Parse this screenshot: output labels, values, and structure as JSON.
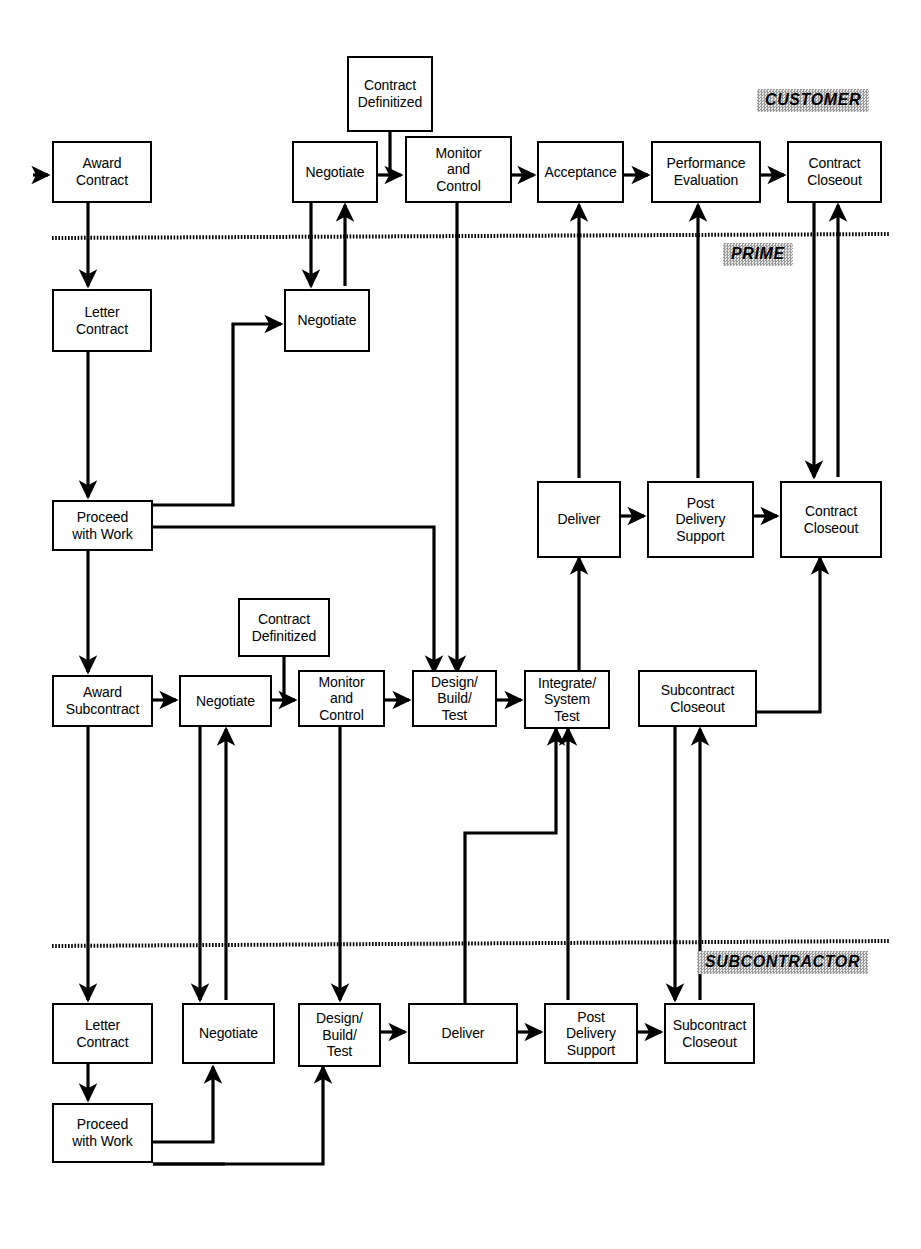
{
  "diagram": {
    "swimlanes": [
      {
        "id": "customer",
        "label": "CUSTOMER"
      },
      {
        "id": "prime",
        "label": "PRIME"
      },
      {
        "id": "subcontractor",
        "label": "SUBCONTRACTOR"
      }
    ],
    "nodes": [
      {
        "id": "cust-award-contract",
        "label": "Award\nContract",
        "lane": "customer"
      },
      {
        "id": "cust-contract-definitized",
        "label": "Contract\nDefinitized",
        "lane": "customer"
      },
      {
        "id": "cust-negotiate",
        "label": "Negotiate",
        "lane": "customer"
      },
      {
        "id": "cust-monitor-control",
        "label": "Monitor\nand\nControl",
        "lane": "customer"
      },
      {
        "id": "cust-acceptance",
        "label": "Acceptance",
        "lane": "customer"
      },
      {
        "id": "cust-performance-eval",
        "label": "Performance\nEvaluation",
        "lane": "customer"
      },
      {
        "id": "cust-contract-closeout",
        "label": "Contract\nCloseout",
        "lane": "customer"
      },
      {
        "id": "prime-letter-contract",
        "label": "Letter\nContract",
        "lane": "prime"
      },
      {
        "id": "prime-negotiate",
        "label": "Negotiate",
        "lane": "prime"
      },
      {
        "id": "prime-proceed-with-work",
        "label": "Proceed\nwith Work",
        "lane": "prime"
      },
      {
        "id": "prime-deliver",
        "label": "Deliver",
        "lane": "prime"
      },
      {
        "id": "prime-post-delivery",
        "label": "Post\nDelivery\nSupport",
        "lane": "prime"
      },
      {
        "id": "prime-contract-closeout",
        "label": "Contract\nCloseout",
        "lane": "prime"
      },
      {
        "id": "prime-award-subcontract",
        "label": "Award\nSubcontract",
        "lane": "prime"
      },
      {
        "id": "prime-sub-negotiate",
        "label": "Negotiate",
        "lane": "prime"
      },
      {
        "id": "prime-sub-definitized",
        "label": "Contract\nDefinitized",
        "lane": "prime"
      },
      {
        "id": "prime-sub-monitor",
        "label": "Monitor\nand\nControl",
        "lane": "prime"
      },
      {
        "id": "prime-design-build-test",
        "label": "Design/\nBuild/\nTest",
        "lane": "prime"
      },
      {
        "id": "prime-integrate-system",
        "label": "Integrate/\nSystem\nTest",
        "lane": "prime"
      },
      {
        "id": "prime-subcontract-closeout",
        "label": "Subcontract\nCloseout",
        "lane": "prime"
      },
      {
        "id": "sub-letter-contract",
        "label": "Letter\nContract",
        "lane": "subcontractor"
      },
      {
        "id": "sub-negotiate",
        "label": "Negotiate",
        "lane": "subcontractor"
      },
      {
        "id": "sub-design-build-test",
        "label": "Design/\nBuild/\nTest",
        "lane": "subcontractor"
      },
      {
        "id": "sub-deliver",
        "label": "Deliver",
        "lane": "subcontractor"
      },
      {
        "id": "sub-post-delivery",
        "label": "Post\nDelivery\nSupport",
        "lane": "subcontractor"
      },
      {
        "id": "sub-proceed-with-work",
        "label": "Proceed\nwith Work",
        "lane": "subcontractor"
      },
      {
        "id": "sub-subcontract-closeout",
        "label": "Subcontract\nCloseout",
        "lane": "subcontractor"
      }
    ],
    "colors": {
      "line": "#000000",
      "box_fill": "#ffffff",
      "box_stroke": "#000000",
      "lane_label_fill": "#c8c8c8"
    }
  }
}
